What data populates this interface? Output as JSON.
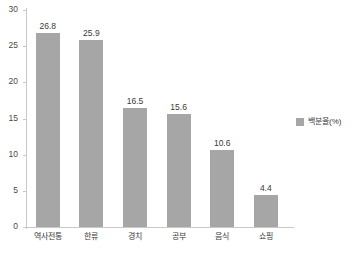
{
  "chart_data": {
    "type": "bar",
    "title": "",
    "xlabel": "",
    "ylabel": "",
    "categories": [
      "역사전통",
      "한류",
      "경치",
      "공부",
      "음식",
      "쇼핑"
    ],
    "values": [
      26.8,
      25.9,
      16.5,
      15.6,
      10.6,
      4.4
    ],
    "value_labels": [
      "26.8",
      "25.9",
      "16.5",
      "15.6",
      "10.6",
      "4.4"
    ],
    "series": [
      {
        "name": "백분율(%)",
        "color": "#a6a6a6",
        "values": [
          26.8,
          25.9,
          16.5,
          15.6,
          10.6,
          4.4
        ]
      }
    ],
    "ylim": [
      0,
      30
    ],
    "ytick_values": [
      30,
      25,
      20,
      15,
      10,
      5,
      0
    ],
    "ytick_labels": [
      "30",
      "25",
      "20",
      "15",
      "10",
      "5",
      "0"
    ],
    "grid": false,
    "legend_position": "right",
    "legend_entries": [
      "백분율(%)"
    ],
    "bar_color": "#a6a6a6",
    "axis_color": "#c9c9c9",
    "background_color": "#ffffff"
  }
}
